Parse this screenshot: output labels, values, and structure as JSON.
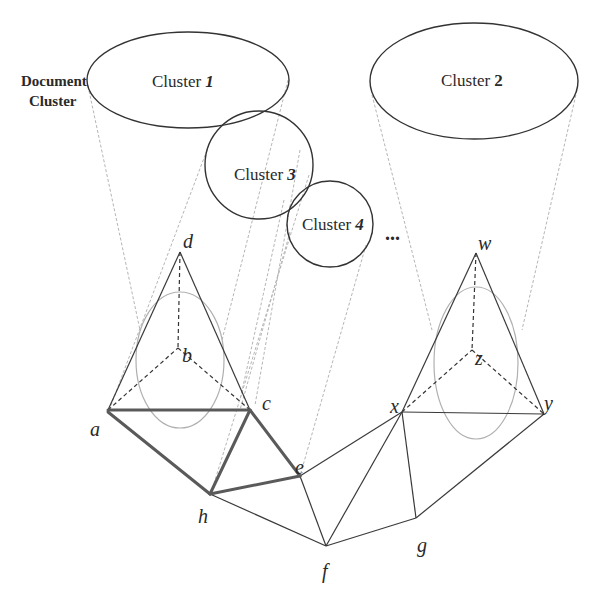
{
  "diagram": {
    "side_label": {
      "line1": "Document",
      "line2": "Cluster"
    },
    "clusters": [
      {
        "id": "cluster-1",
        "label": "Cluster 1",
        "prefix": "Cluster ",
        "number": "1"
      },
      {
        "id": "cluster-2",
        "label": "Cluster 2",
        "prefix": "Cluster ",
        "number": "2"
      },
      {
        "id": "cluster-3",
        "label": "Cluster 3",
        "prefix": "Cluster ",
        "number": "3"
      },
      {
        "id": "cluster-4",
        "label": "Cluster 4",
        "prefix": "Cluster ",
        "number": "4"
      }
    ],
    "ellipsis": "...",
    "nodes": {
      "a": "a",
      "b": "b",
      "c": "c",
      "d": "d",
      "e": "e",
      "f": "f",
      "g": "g",
      "h": "h",
      "w": "w",
      "x": "x",
      "y": "y",
      "z": "z"
    },
    "edges_solid_bold": [
      [
        "a",
        "c"
      ],
      [
        "a",
        "h"
      ],
      [
        "c",
        "h"
      ],
      [
        "c",
        "e"
      ],
      [
        "h",
        "e"
      ]
    ],
    "edges_solid": [
      [
        "a",
        "d"
      ],
      [
        "d",
        "c"
      ],
      [
        "h",
        "f"
      ],
      [
        "e",
        "f"
      ],
      [
        "e",
        "x"
      ],
      [
        "f",
        "x"
      ],
      [
        "f",
        "g"
      ],
      [
        "x",
        "g"
      ],
      [
        "g",
        "y"
      ],
      [
        "x",
        "y"
      ],
      [
        "x",
        "w"
      ],
      [
        "w",
        "y"
      ]
    ],
    "edges_dashed": [
      [
        "d",
        "b"
      ],
      [
        "a",
        "b"
      ],
      [
        "b",
        "c"
      ],
      [
        "w",
        "z"
      ],
      [
        "x",
        "z"
      ],
      [
        "z",
        "y"
      ]
    ],
    "colors": {
      "stroke": "#333333",
      "bold_edge": "#555555",
      "projection": "#aaaaaa",
      "inner_ellipse": "#b0b0b0"
    }
  }
}
